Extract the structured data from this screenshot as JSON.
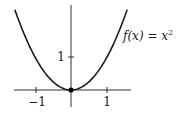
{
  "chart_data": {
    "type": "line",
    "title": "",
    "function_label": "f(x) = x²",
    "function_label_parts": {
      "lhs": "f(x) = x",
      "exponent": "2"
    },
    "expression": "x^2",
    "xlabel": "",
    "ylabel": "",
    "xlim": [
      -1.6,
      1.6
    ],
    "ylim": [
      -0.5,
      2.6
    ],
    "x_ticks": [
      -1,
      1
    ],
    "x_tick_labels": [
      "−1",
      "1"
    ],
    "y_ticks": [
      1
    ],
    "y_tick_labels": [
      "1"
    ],
    "grid": false,
    "legend": "none",
    "marked_point": {
      "x": 0,
      "y": 0
    },
    "series": [
      {
        "name": "f(x) = x²",
        "x": [
          -1.55,
          -1.25,
          -1.0,
          -0.75,
          -0.5,
          -0.25,
          0,
          0.25,
          0.5,
          0.75,
          1.0,
          1.25,
          1.55
        ],
        "y": [
          2.4025,
          1.5625,
          1.0,
          0.5625,
          0.25,
          0.0625,
          0,
          0.0625,
          0.25,
          0.5625,
          1.0,
          1.5625,
          2.4025
        ]
      }
    ],
    "colors": {
      "curve": "#1a1a1a",
      "axes": "#333333"
    }
  }
}
